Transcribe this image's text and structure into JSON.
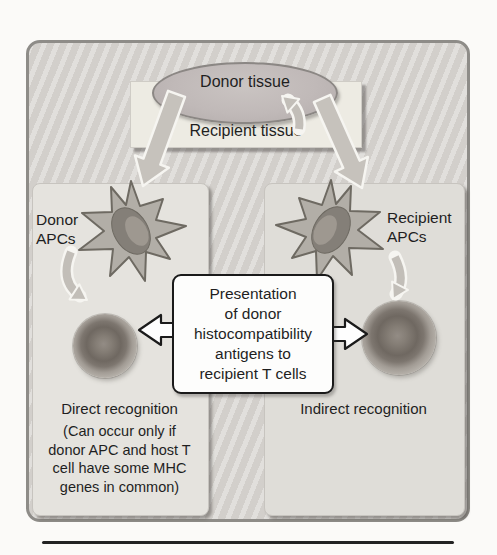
{
  "figure": {
    "donor_tissue_label": "Donor tissue",
    "recipient_tissue_label": "Recipient tissue",
    "left_panel": {
      "apc_label": "Donor APCs",
      "recognition_label": "Direct recognition",
      "note_lines": [
        "(Can occur only if",
        "donor APC and host T",
        "cell have some MHC",
        "genes in common)"
      ]
    },
    "right_panel": {
      "apc_label": "Recipient APCs",
      "recognition_label": "Indirect recognition"
    },
    "center_box": {
      "lines": [
        "Presentation",
        "of donor",
        "histocompatibility",
        "antigens to",
        "recipient T cells"
      ]
    },
    "colors": {
      "frame_fill": "#d9d6d2",
      "frame_border": "#8e8c88",
      "panel_left_fill": "#e5e3de",
      "panel_right_fill": "#dfddd8",
      "tissue_rect_fill": "#edebe3",
      "donor_ellipse_fill": "#c0b9b8",
      "arrow_fill": "#c6c2bc",
      "arrow_outline": "#f6f5f1",
      "cell_dark": "#6f6861",
      "center_box_border": "#1a1a1a",
      "bottom_rule": "#232323"
    }
  }
}
